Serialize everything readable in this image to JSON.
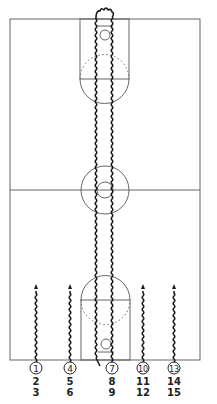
{
  "diagram": {
    "colors": {
      "lines": "#555555",
      "path": "#1a1a1a",
      "background": "#ffffff"
    },
    "court": {
      "outer": {
        "x": 10,
        "y": 19,
        "w": 190,
        "h": 341
      },
      "half_court_y": 190,
      "center_circle": {
        "cx": 105,
        "cy": 190,
        "r_outer": 24,
        "r_inner": 8
      },
      "top_lane": {
        "x": 80,
        "y": 19,
        "w": 49,
        "h": 60,
        "basket": {
          "cx": 105,
          "cy": 35,
          "r": 5
        }
      },
      "bottom_lane": {
        "x": 81,
        "y": 300,
        "w": 49,
        "h": 60,
        "basket": {
          "cx": 106,
          "cy": 344,
          "r": 5
        }
      }
    },
    "players": [
      {
        "circle_label": "1",
        "below": [
          "2",
          "3"
        ],
        "x": 36
      },
      {
        "circle_label": "4",
        "below": [
          "5",
          "6"
        ],
        "x": 70
      },
      {
        "circle_label": "7",
        "below": [
          "8",
          "9"
        ],
        "x": 112
      },
      {
        "circle_label": "10",
        "below": [
          "11",
          "12"
        ],
        "x": 143
      },
      {
        "circle_label": "13",
        "below": [
          "14",
          "15"
        ],
        "x": 174
      }
    ]
  }
}
